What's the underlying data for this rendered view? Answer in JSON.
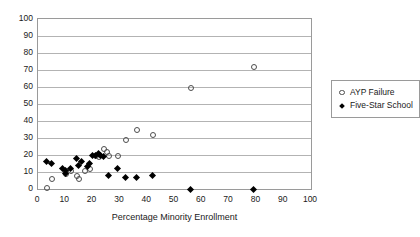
{
  "chart_data": {
    "type": "scatter",
    "title": "",
    "xlabel": "Percentage Minority Enrollment",
    "ylabel": "",
    "xlim": [
      0,
      100
    ],
    "ylim": [
      0,
      100
    ],
    "xticks": [
      0,
      10,
      20,
      30,
      40,
      50,
      60,
      70,
      80,
      90,
      100
    ],
    "yticks": [
      0,
      10,
      20,
      30,
      40,
      50,
      60,
      70,
      80,
      90,
      100
    ],
    "grid": "horizontal",
    "legend_position": "right",
    "series": [
      {
        "name": "AYP Failure",
        "marker": "open-circle",
        "color": "#4d4d4d",
        "points": [
          [
            3,
            1
          ],
          [
            5,
            6
          ],
          [
            10,
            9
          ],
          [
            12,
            11
          ],
          [
            14,
            8
          ],
          [
            15,
            6
          ],
          [
            17,
            11
          ],
          [
            19,
            12
          ],
          [
            21,
            20
          ],
          [
            22,
            19
          ],
          [
            24,
            24
          ],
          [
            25,
            22
          ],
          [
            26,
            20
          ],
          [
            29,
            20
          ],
          [
            32,
            29
          ],
          [
            36,
            35
          ],
          [
            42,
            32
          ],
          [
            56,
            60
          ],
          [
            79,
            72
          ]
        ]
      },
      {
        "name": "Five-Star School",
        "marker": "filled-diamond",
        "color": "#000000",
        "points": [
          [
            3,
            16
          ],
          [
            5,
            15
          ],
          [
            9,
            12
          ],
          [
            10,
            11
          ],
          [
            10,
            9
          ],
          [
            12,
            12
          ],
          [
            14,
            18
          ],
          [
            15,
            14
          ],
          [
            16,
            16
          ],
          [
            18,
            13
          ],
          [
            19,
            15
          ],
          [
            20,
            20
          ],
          [
            21,
            20
          ],
          [
            22,
            21
          ],
          [
            23,
            20
          ],
          [
            24,
            19
          ],
          [
            26,
            8
          ],
          [
            29,
            12
          ],
          [
            32,
            7
          ],
          [
            36,
            7
          ],
          [
            42,
            8
          ],
          [
            56,
            0
          ],
          [
            79,
            0
          ]
        ]
      }
    ]
  },
  "legend": {
    "items": [
      {
        "label": "AYP Failure"
      },
      {
        "label": "Five-Star School"
      }
    ]
  }
}
